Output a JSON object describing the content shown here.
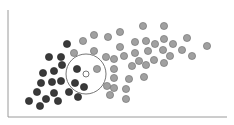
{
  "chart_data": {
    "type": "scatter",
    "title": "",
    "xlabel": "",
    "ylabel": "",
    "grid": false,
    "legend": null,
    "axes": {
      "x_axis": {
        "x1": 8,
        "x2": 227,
        "y": 117
      },
      "y_axis": {
        "x": 8,
        "y1": 10,
        "y2": 117
      },
      "color": "#9a9a9a"
    },
    "annotation": {
      "type": "circle",
      "description": "neighborhood circle around query point",
      "cx": 86,
      "cy": 74,
      "r": 20,
      "stroke": "#777777"
    },
    "query_point": {
      "x": 86,
      "y": 74,
      "fill": "#ffffff",
      "stroke": "#555555"
    },
    "series": [
      {
        "name": "class A (dark)",
        "color": "#3a3a3a",
        "stroke": "#222222",
        "points": [
          [
            67,
            44
          ],
          [
            49,
            57
          ],
          [
            61,
            57
          ],
          [
            62,
            65
          ],
          [
            54,
            71
          ],
          [
            43,
            73
          ],
          [
            41,
            83
          ],
          [
            52,
            82
          ],
          [
            61,
            81
          ],
          [
            77,
            69
          ],
          [
            75,
            83
          ],
          [
            84,
            87
          ],
          [
            69,
            92
          ],
          [
            78,
            97
          ],
          [
            37,
            92
          ],
          [
            54,
            93
          ],
          [
            46,
            99
          ],
          [
            58,
            101
          ],
          [
            29,
            101
          ],
          [
            40,
            106
          ]
        ]
      },
      {
        "name": "class B (light)",
        "color": "#a0a0a0",
        "stroke": "#6a6a6a",
        "points": [
          [
            83,
            41
          ],
          [
            94,
            35
          ],
          [
            108,
            37
          ],
          [
            74,
            53
          ],
          [
            94,
            51
          ],
          [
            106,
            57
          ],
          [
            97,
            69
          ],
          [
            114,
            59
          ],
          [
            114,
            69
          ],
          [
            114,
            78
          ],
          [
            107,
            86
          ],
          [
            114,
            88
          ],
          [
            110,
            95
          ],
          [
            120,
            32
          ],
          [
            143,
            26
          ],
          [
            164,
            26
          ],
          [
            120,
            47
          ],
          [
            135,
            42
          ],
          [
            146,
            41
          ],
          [
            155,
            44
          ],
          [
            164,
            39
          ],
          [
            173,
            44
          ],
          [
            187,
            38
          ],
          [
            207,
            46
          ],
          [
            124,
            56
          ],
          [
            135,
            53
          ],
          [
            148,
            51
          ],
          [
            163,
            50
          ],
          [
            182,
            50
          ],
          [
            192,
            56
          ],
          [
            170,
            56
          ],
          [
            139,
            61
          ],
          [
            154,
            60
          ],
          [
            164,
            63
          ],
          [
            132,
            66
          ],
          [
            146,
            65
          ],
          [
            129,
            79
          ],
          [
            144,
            77
          ],
          [
            126,
            89
          ],
          [
            126,
            99
          ]
        ]
      }
    ],
    "point_radius": 3.6
  }
}
